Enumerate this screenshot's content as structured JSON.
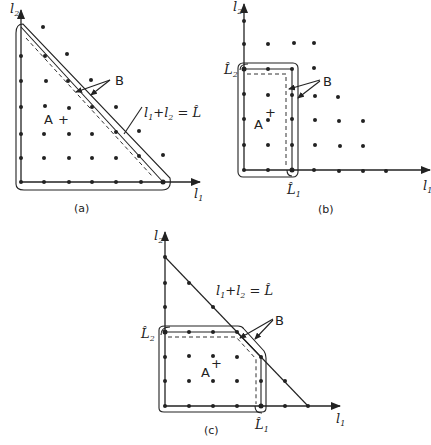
{
  "figures": [
    {
      "id": "a",
      "caption": "(a)",
      "x_axis_label": "l1",
      "y_axis_label": "l2",
      "region_label": "A",
      "boundary_label": "B",
      "constraint_label": "l1 + l2 = L̂",
      "description": "Triangular feasible lattice region bounded by l1 + l2 = L̂; boundary B runs along the axes and the diagonal"
    },
    {
      "id": "b",
      "caption": "(b)",
      "x_axis_label": "l1",
      "y_axis_label": "l2",
      "region_label": "A",
      "boundary_label": "B",
      "x_limit_label": "L̂1",
      "y_limit_label": "L̂2",
      "description": "Rectangular lattice region bounded by l1 ≤ L̂1 and l2 ≤ L̂2"
    },
    {
      "id": "c",
      "caption": "(c)",
      "x_axis_label": "l1",
      "y_axis_label": "l2",
      "region_label": "A",
      "boundary_label": "B",
      "x_limit_label": "L̂1",
      "y_limit_label": "L̂2",
      "constraint_label": "l1 + l2 = L̂",
      "description": "Rectangle with corner clipped by the diagonal l1 + l2 = L̂"
    }
  ],
  "text": {
    "l": "l",
    "sub1": "1",
    "sub2": "2",
    "L": "L̂",
    "A": "A",
    "B": "B",
    "plus": "+",
    "eq_plus": "+",
    "eq_equals": "=",
    "cap_a": "(a)",
    "cap_b": "(b)",
    "cap_c": "(c)"
  }
}
